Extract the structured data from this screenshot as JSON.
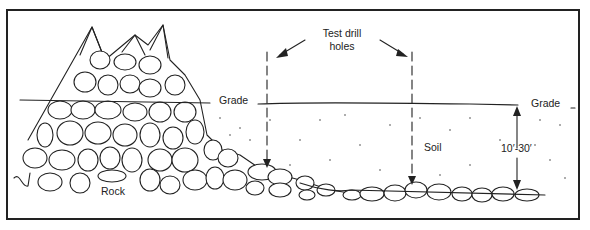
{
  "diagram": {
    "labels": {
      "test_drill_holes_line1": "Test drill",
      "test_drill_holes_line2": "holes",
      "grade_left": "Grade",
      "grade_right": "Grade",
      "soil": "Soil",
      "rock": "Rock",
      "depth": "10′-30′"
    },
    "colors": {
      "ink": "#222222",
      "background": "#ffffff"
    }
  }
}
